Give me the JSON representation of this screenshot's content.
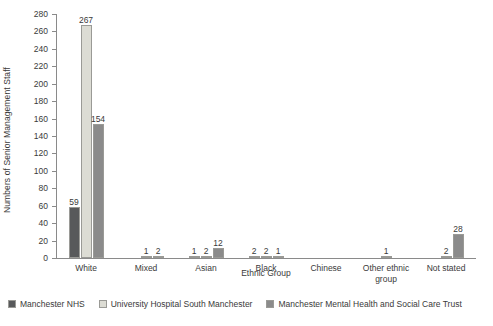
{
  "chart_data": {
    "type": "bar",
    "title": "",
    "xlabel": "Ethnic Group",
    "ylabel": "Numbers of Senior Management Staff",
    "ylim": [
      0,
      280
    ],
    "yticks": [
      0,
      20,
      40,
      60,
      80,
      100,
      120,
      140,
      160,
      180,
      200,
      220,
      240,
      260,
      280
    ],
    "grid": false,
    "legend_position": "bottom",
    "categories": [
      "White",
      "Mixed",
      "Asian",
      "Black",
      "Chinese",
      "Other ethnic group",
      "Not stated"
    ],
    "series": [
      {
        "name": "Manchester NHS",
        "color": "#58595b",
        "values": [
          59,
          0,
          1,
          2,
          0,
          0,
          0
        ],
        "labels": [
          "59",
          "",
          "1",
          "2",
          "",
          "",
          ""
        ]
      },
      {
        "name": "University Hospital South Manchester",
        "color": "#dcdcd4",
        "values": [
          267,
          1,
          2,
          2,
          0,
          1,
          2
        ],
        "labels": [
          "267",
          "1",
          "2",
          "2",
          "",
          "1",
          "2"
        ]
      },
      {
        "name": "Manchester Mental Health and Social Care Trust",
        "color": "#8b8b8b",
        "values": [
          154,
          2,
          12,
          1,
          0,
          0,
          28
        ],
        "labels": [
          "154",
          "2",
          "12",
          "1",
          "",
          "",
          "28"
        ]
      }
    ]
  }
}
